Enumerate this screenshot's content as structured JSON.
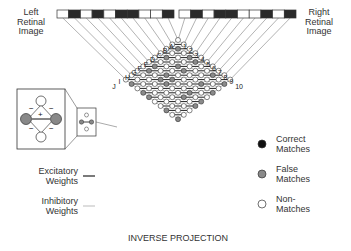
{
  "labels": {
    "left_image": [
      "Left",
      "Retinal",
      "Image"
    ],
    "right_image": [
      "Right",
      "Retinal",
      "Image"
    ],
    "excitatory": [
      "Excitatory",
      "Weights"
    ],
    "inhibitory": [
      "Inhibitory",
      "Weights"
    ],
    "caption": "INVERSE PROJECTION",
    "legend": [
      {
        "lines": [
          "Correct",
          "Matches"
        ],
        "color": "#111111"
      },
      {
        "lines": [
          "False",
          "Matches"
        ],
        "color": "#8a8a8a"
      },
      {
        "lines": [
          "Non-",
          "Matches"
        ],
        "color": "#ffffff"
      }
    ],
    "left_axis": [
      "A",
      "B",
      "C",
      "D",
      "E",
      "F",
      "G",
      "H",
      "I",
      "J"
    ],
    "right_axis": [
      "1",
      "2",
      "3",
      "4",
      "5",
      "6",
      "7",
      "8",
      "9",
      "10"
    ],
    "inset_signs": {
      "plus": "+",
      "minus": "−"
    }
  },
  "retina": {
    "left_pattern": [
      0,
      1,
      0,
      1,
      0,
      1,
      1,
      0,
      0,
      1
    ],
    "right_pattern": [
      0,
      1,
      0,
      1,
      1,
      0,
      0,
      1,
      0,
      1
    ]
  },
  "colors": {
    "black": "#111111",
    "gray": "#8a8a8a",
    "white": "#ffffff",
    "line": "#555555"
  }
}
